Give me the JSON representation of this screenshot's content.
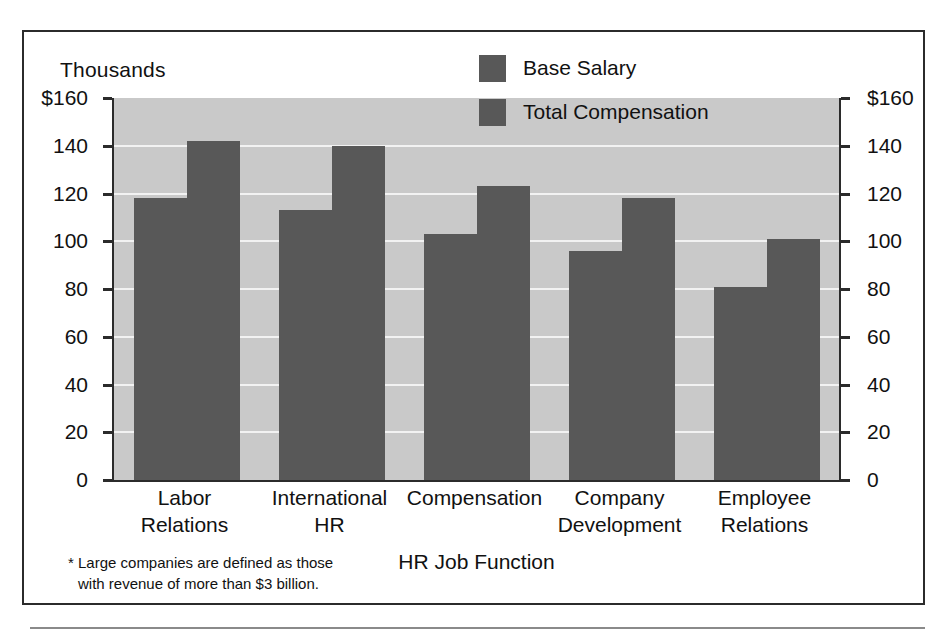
{
  "figure": {
    "units_label": "Thousands",
    "x_axis_title": "HR Job Function",
    "footnote_line1": "* Large companies are defined as those",
    "footnote_line2": "with revenue of more than $3 billion.",
    "plot_background": "#c9c9c9",
    "bar_color": "#585858",
    "gridline_color": "#f2f2f2",
    "frame_color": "#2b2b2b"
  },
  "chart_data": {
    "type": "bar",
    "title": "",
    "xlabel": "HR Job Function",
    "ylabel": "Thousands",
    "ylim": [
      0,
      160
    ],
    "yticks": [
      0,
      20,
      40,
      60,
      80,
      100,
      120,
      140,
      160
    ],
    "ytick_labels": [
      "0",
      "20",
      "40",
      "60",
      "80",
      "100",
      "120",
      "140",
      "$160"
    ],
    "ytick_labels_right": [
      "0",
      "20",
      "40",
      "60",
      "80",
      "100",
      "120",
      "140",
      "$160"
    ],
    "grid": true,
    "legend_position": "upper right",
    "categories": [
      "Labor Relations",
      "International HR",
      "Compensation",
      "Company Development",
      "Employee Relations"
    ],
    "category_lines": [
      [
        "Labor",
        "Relations"
      ],
      [
        "International",
        "HR"
      ],
      [
        "Compensation",
        ""
      ],
      [
        "Company",
        "Development"
      ],
      [
        "Employee",
        "Relations"
      ]
    ],
    "series": [
      {
        "name": "Base Salary",
        "values": [
          118,
          113,
          103,
          96,
          81
        ]
      },
      {
        "name": "Total Compensation",
        "values": [
          142,
          140,
          123,
          118,
          101
        ]
      }
    ]
  }
}
